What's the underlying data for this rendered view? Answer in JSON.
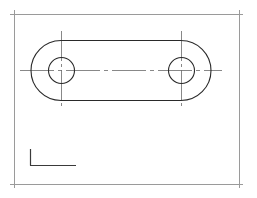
{
  "drawing": {
    "title": "Obround plate with two holes",
    "colors": {
      "background": "#ffffff",
      "frame": "#9a9a9a",
      "outline": "#2a2a2a",
      "centerline": "#6a6a6a",
      "ucs": "#3a3a3a"
    },
    "frame": {
      "x1": 14,
      "y1": 14,
      "x2": 239,
      "y2": 184,
      "overhang": 4
    },
    "part": {
      "shape": "obround",
      "left_center": [
        61,
        70
      ],
      "right_center": [
        181,
        70
      ],
      "outer_radius": 30,
      "hole_radius": 13
    },
    "centerlines": {
      "horizontal": {
        "x1": 20,
        "x2": 222,
        "y": 70
      },
      "vertical_left": {
        "x": 61,
        "y1": 31,
        "y2": 109
      },
      "vertical_right": {
        "x": 181,
        "y1": 31,
        "y2": 109
      }
    },
    "ucs_icon": {
      "origin": [
        30,
        165
      ],
      "y_end": 149,
      "x_end": 76
    }
  }
}
